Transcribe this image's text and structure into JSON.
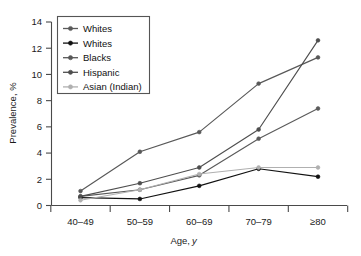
{
  "chart_data": {
    "type": "line",
    "title": "",
    "xlabel": "Age, y",
    "ylabel": "Prevalence, %",
    "categories": [
      "40–49",
      "50–59",
      "60–69",
      "70–79",
      "≥80"
    ],
    "xtick_labels": [
      "40–49",
      "50–59",
      "60–69",
      "70–79",
      "≥80"
    ],
    "ytick_labels": [
      "0",
      "2",
      "4",
      "6",
      "8",
      "10",
      "12",
      "14"
    ],
    "ytick_values": [
      0,
      2,
      4,
      6,
      8,
      10,
      12,
      14
    ],
    "ylim": [
      0,
      14
    ],
    "grid": false,
    "legend_position": "upper-left",
    "series": [
      {
        "name": "Whites",
        "color": "#5a5a5a",
        "marker": "circle",
        "values": [
          0.7,
          1.2,
          2.3,
          5.1,
          7.4
        ]
      },
      {
        "name": "Whites",
        "color": "#111111",
        "marker": "circle",
        "values": [
          0.6,
          0.5,
          1.5,
          2.8,
          2.2
        ]
      },
      {
        "name": "Blacks",
        "color": "#585858",
        "marker": "circle",
        "values": [
          1.1,
          4.1,
          5.6,
          9.3,
          11.3
        ]
      },
      {
        "name": "Hispanic",
        "color": "#4e4e4e",
        "marker": "circle",
        "values": [
          0.7,
          1.7,
          2.9,
          5.8,
          12.6
        ]
      },
      {
        "name": "Asian (Indian)",
        "color": "#b0b0b0",
        "marker": "circle",
        "values": [
          0.4,
          1.2,
          2.4,
          2.9,
          2.9
        ]
      }
    ]
  },
  "axes": {
    "y_title": "Prevalence, %",
    "x_title_main": "Age,",
    "x_title_italic": "y"
  }
}
